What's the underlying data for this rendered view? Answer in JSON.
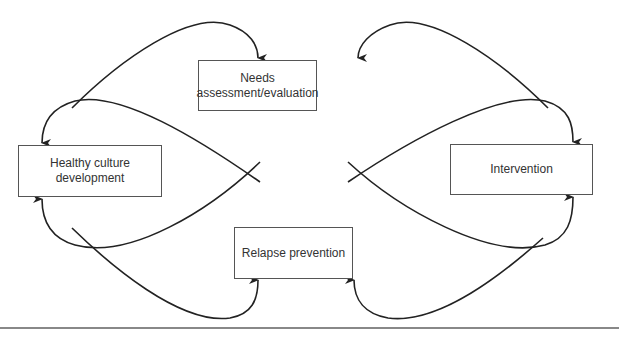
{
  "diagram": {
    "type": "cycle",
    "nodes": [
      {
        "id": "needs",
        "label_line1": "Needs",
        "label_line2": "assessment/evaluation"
      },
      {
        "id": "healthy",
        "label_line1": "Healthy culture",
        "label_line2": "development"
      },
      {
        "id": "intervention",
        "label_line1": "Intervention"
      },
      {
        "id": "relapse",
        "label_line1": "Relapse prevention"
      }
    ],
    "edges": [
      {
        "from": "healthy",
        "to": "needs"
      },
      {
        "from": "intervention",
        "to": "needs"
      },
      {
        "from": "needs",
        "to": "healthy"
      },
      {
        "from": "needs",
        "to": "intervention"
      },
      {
        "from": "relapse",
        "to": "healthy"
      },
      {
        "from": "relapse",
        "to": "intervention"
      },
      {
        "from": "healthy",
        "to": "relapse"
      },
      {
        "from": "intervention",
        "to": "relapse"
      }
    ],
    "colors": {
      "line": "#222222",
      "box_border": "#555555",
      "text": "#333333"
    }
  }
}
